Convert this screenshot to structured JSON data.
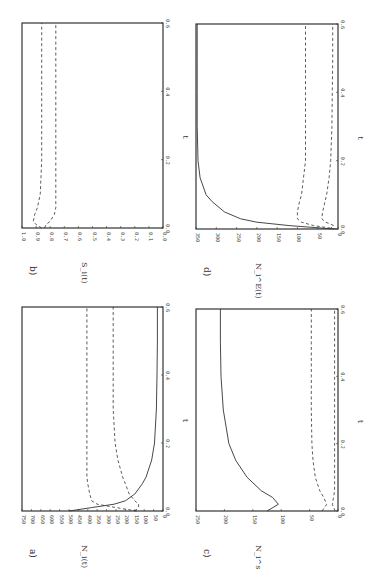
{
  "figure": {
    "orientation": "rotated 90 degrees counter-clockwise",
    "panels": [
      {
        "id": "a",
        "label": "a)",
        "ylabel": "N_i(t)",
        "ylabel_display": "N_i(t)"
      },
      {
        "id": "b",
        "label": "b)",
        "ylabel": "S_i(t)",
        "ylabel_display": "S_i(t)"
      },
      {
        "id": "c",
        "label": "c)",
        "ylabel": "N_i^s(t)",
        "ylabel_display": "N_i^s(t)"
      },
      {
        "id": "d",
        "label": "d)",
        "ylabel": "N_i^E(t)",
        "ylabel_display": "N_i^E(t)"
      }
    ],
    "xlabel": "t"
  },
  "chart_data": [
    {
      "panel": "a",
      "type": "line",
      "title": "a)",
      "xlabel": "t",
      "ylabel": "N_i(t)",
      "xlim": [
        0.0,
        0.6
      ],
      "ylim": [
        0,
        750
      ],
      "x_ticks": [
        "0.0",
        "0.2",
        "0.4",
        "0.6"
      ],
      "y_ticks": [
        "750",
        "700",
        "650",
        "600",
        "550",
        "500",
        "450",
        "400",
        "350",
        "300",
        "250",
        "200",
        "150",
        "100",
        "50",
        "0"
      ],
      "grid": false,
      "legend": null,
      "x": [
        0.0,
        0.01,
        0.02,
        0.03,
        0.05,
        0.08,
        0.1,
        0.15,
        0.2,
        0.3,
        0.4,
        0.5,
        0.6
      ],
      "series": [
        {
          "name": "solid",
          "style": "solid",
          "values": [
            500,
            380,
            260,
            200,
            150,
            110,
            90,
            60,
            45,
            35,
            32,
            30,
            30
          ]
        },
        {
          "name": "dashed-1",
          "style": "dashed",
          "values": [
            140,
            250,
            350,
            380,
            390,
            400,
            405,
            405,
            405,
            405,
            405,
            405,
            405
          ]
        },
        {
          "name": "dashed-2",
          "style": "dashed",
          "values": [
            150,
            130,
            130,
            150,
            180,
            200,
            215,
            240,
            255,
            265,
            265,
            265,
            265
          ]
        }
      ]
    },
    {
      "panel": "b",
      "type": "line",
      "title": "b)",
      "xlabel": "t",
      "ylabel": "S_i(t)",
      "xlim": [
        0.0,
        0.6
      ],
      "ylim": [
        0.0,
        1.0
      ],
      "x_ticks": [
        "0.0",
        "0.2",
        "0.4",
        "0.6"
      ],
      "y_ticks": [
        "1.0",
        "0.9",
        "0.8",
        "0.7",
        "0.6",
        "0.5",
        "0.4",
        "0.3",
        "0.2",
        "0.1",
        "0.0"
      ],
      "grid": false,
      "legend": null,
      "x": [
        0.0,
        0.01,
        0.02,
        0.04,
        0.06,
        0.1,
        0.2,
        0.3,
        0.4,
        0.5,
        0.6
      ],
      "series": [
        {
          "name": "dashed-1",
          "style": "dashed",
          "values": [
            0.86,
            0.9,
            0.92,
            0.91,
            0.89,
            0.87,
            0.86,
            0.86,
            0.86,
            0.86,
            0.86
          ]
        },
        {
          "name": "dashed-2",
          "style": "dashed",
          "values": [
            0.84,
            0.83,
            0.8,
            0.77,
            0.76,
            0.76,
            0.76,
            0.76,
            0.76,
            0.76,
            0.76
          ]
        }
      ]
    },
    {
      "panel": "c",
      "type": "line",
      "title": "c)",
      "xlabel": "t",
      "ylabel": "N_i^s(t)",
      "xlim": [
        0.0,
        0.6
      ],
      "ylim": [
        0,
        250
      ],
      "x_ticks": [
        "0.0",
        "0.2",
        "0.4",
        "0.6"
      ],
      "y_ticks": [
        "250",
        "200",
        "150",
        "100",
        "50",
        "0"
      ],
      "grid": false,
      "legend": null,
      "x": [
        0.0,
        0.02,
        0.04,
        0.06,
        0.1,
        0.15,
        0.2,
        0.3,
        0.4,
        0.5,
        0.6
      ],
      "series": [
        {
          "name": "solid",
          "style": "solid",
          "values": [
            125,
            105,
            115,
            135,
            160,
            180,
            192,
            202,
            206,
            207,
            207
          ]
        },
        {
          "name": "dashed-1",
          "style": "dashed",
          "values": [
            28,
            20,
            25,
            32,
            40,
            44,
            46,
            47,
            47,
            47,
            47
          ]
        },
        {
          "name": "dashed-2",
          "style": "dashed",
          "values": [
            5,
            10,
            8,
            6,
            6,
            6,
            6,
            6,
            6,
            6,
            6
          ]
        }
      ]
    },
    {
      "panel": "d",
      "type": "line",
      "title": "d)",
      "xlabel": "t",
      "ylabel": "N_i^E(t)",
      "xlim": [
        0.0,
        0.6
      ],
      "ylim": [
        0,
        350
      ],
      "x_ticks": [
        "0.0",
        "0.2",
        "0.4",
        "0.6"
      ],
      "y_ticks": [
        "350",
        "300",
        "250",
        "200",
        "150",
        "100",
        "50",
        "0"
      ],
      "grid": false,
      "legend": null,
      "x": [
        0.0,
        0.01,
        0.02,
        0.03,
        0.05,
        0.08,
        0.1,
        0.15,
        0.2,
        0.3,
        0.4,
        0.5,
        0.6
      ],
      "series": [
        {
          "name": "solid",
          "style": "solid",
          "values": [
            10,
            120,
            200,
            240,
            280,
            310,
            325,
            340,
            345,
            347,
            347,
            347,
            347
          ]
        },
        {
          "name": "dashed-1",
          "style": "dashed",
          "values": [
            5,
            60,
            90,
            100,
            100,
            95,
            90,
            85,
            80,
            80,
            80,
            80,
            80
          ]
        },
        {
          "name": "dashed-2",
          "style": "dashed",
          "values": [
            20,
            10,
            30,
            40,
            38,
            32,
            28,
            22,
            18,
            15,
            14,
            13,
            13
          ]
        }
      ]
    }
  ]
}
